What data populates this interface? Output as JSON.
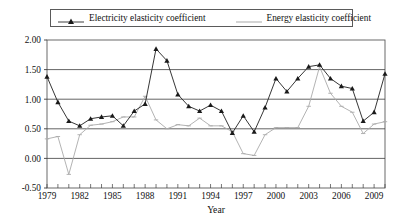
{
  "legend": {
    "position": "top",
    "entries": [
      {
        "label": "Electricity elasticity coefficient",
        "marker": "triangle-marker-icon",
        "color": "#2b2b2b"
      },
      {
        "label": "Energy elasticity coefficient",
        "marker": "line-marker-icon",
        "color": "#aaaaaa"
      }
    ]
  },
  "chart_data": {
    "type": "line",
    "title": "",
    "subtitle": "",
    "xlabel": "Year",
    "ylabel": "",
    "grid": true,
    "legend_position": "top",
    "xlim": [
      1979,
      2010
    ],
    "ylim": [
      -0.5,
      2.0
    ],
    "yticks": [
      "2.00",
      "1.50",
      "1.00",
      "0.50",
      "0.00",
      "-0.50"
    ],
    "ytick_values": [
      2.0,
      1.5,
      1.0,
      0.5,
      0.0,
      -0.5
    ],
    "xticks": [
      "1979",
      "1982",
      "1985",
      "1988",
      "1991",
      "1994",
      "1997",
      "2000",
      "2003",
      "2006",
      "2009"
    ],
    "xtick_values": [
      1979,
      1982,
      1985,
      1988,
      1991,
      1994,
      1997,
      2000,
      2003,
      2006,
      2009
    ],
    "x": [
      1979,
      1980,
      1981,
      1982,
      1983,
      1984,
      1985,
      1986,
      1987,
      1988,
      1989,
      1990,
      1991,
      1992,
      1993,
      1994,
      1995,
      1996,
      1997,
      1998,
      1999,
      2000,
      2001,
      2002,
      2003,
      2004,
      2005,
      2006,
      2007,
      2008,
      2009,
      2010
    ],
    "series": [
      {
        "name": "Electricity elasticity coefficient",
        "color": "#2b2b2b",
        "marker": "triangle",
        "values": [
          1.38,
          0.95,
          0.63,
          0.55,
          0.67,
          0.7,
          0.72,
          0.55,
          0.8,
          0.92,
          1.85,
          1.65,
          1.08,
          0.88,
          0.8,
          0.9,
          0.8,
          0.43,
          0.72,
          0.45,
          0.86,
          1.35,
          1.13,
          1.35,
          1.55,
          1.58,
          1.35,
          1.22,
          1.18,
          0.63,
          0.78,
          1.43
        ]
      },
      {
        "name": "Energy elasticity coefficient",
        "color": "#aaaaaa",
        "marker": "dash",
        "values": [
          0.33,
          0.37,
          -0.27,
          0.4,
          0.56,
          0.58,
          0.62,
          0.7,
          0.7,
          1.05,
          0.65,
          0.5,
          0.57,
          0.55,
          0.68,
          0.55,
          0.55,
          0.45,
          0.08,
          0.05,
          0.4,
          0.52,
          0.52,
          0.52,
          0.88,
          1.55,
          1.1,
          0.88,
          0.78,
          0.42,
          0.58,
          0.62
        ]
      }
    ]
  }
}
